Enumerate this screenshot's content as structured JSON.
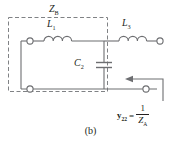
{
  "figure": {
    "caption": "(b)",
    "type": "two-port-ladder-network-schematic"
  },
  "labels": {
    "box_label": "Z",
    "box_label_sub": "B",
    "inductor1": "L",
    "inductor1_sub": "1",
    "inductor3": "L",
    "inductor3_sub": "3",
    "capacitor2": "C",
    "capacitor2_sub": "2"
  },
  "formula": {
    "lhs": "y",
    "lhs_sub": "22",
    "equals": "=",
    "numerator": "1",
    "denominator": "Z",
    "denominator_sub": "A"
  },
  "components": {
    "series_inductor_left": "L1",
    "shunt_capacitor": "C2",
    "series_inductor_right": "L3",
    "dashed_enclosure": "ZB",
    "port_direction_arrow": "arrow-pointing-left-into-port-2"
  },
  "colors": {
    "wire": "#6d6e71",
    "text": "#231f20",
    "dashed_box": "#808285",
    "background": "#ffffff"
  }
}
